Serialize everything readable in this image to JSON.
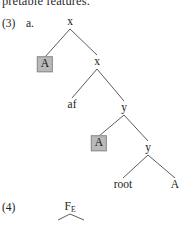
{
  "page": {
    "width": 185,
    "height": 227,
    "background": "#ffffff",
    "clipped_running_text": "pretable features."
  },
  "examples": [
    {
      "number": "(3)",
      "sublabel": "a.",
      "tree": {
        "type": "syntax-tree",
        "nodes": [
          {
            "id": "n1",
            "label": "x",
            "x": 70,
            "y": 22,
            "shaded": false
          },
          {
            "id": "n2",
            "label": "A",
            "x": 45,
            "y": 64,
            "shaded": true
          },
          {
            "id": "n3",
            "label": "x",
            "x": 97,
            "y": 62,
            "shaded": false
          },
          {
            "id": "n4",
            "label": "af",
            "x": 72,
            "y": 105,
            "shaded": false
          },
          {
            "id": "n5",
            "label": "y",
            "x": 124,
            "y": 108,
            "shaded": false
          },
          {
            "id": "n6",
            "label": "A",
            "x": 99,
            "y": 143,
            "shaded": true
          },
          {
            "id": "n7",
            "label": "y",
            "x": 148,
            "y": 148,
            "shaded": false
          },
          {
            "id": "n8",
            "label": "root",
            "x": 123,
            "y": 185,
            "shaded": false
          },
          {
            "id": "n9",
            "label": "A",
            "x": 175,
            "y": 185,
            "shaded": false
          }
        ],
        "edges": [
          {
            "from": "n1",
            "to": "n2"
          },
          {
            "from": "n1",
            "to": "n3"
          },
          {
            "from": "n3",
            "to": "n4"
          },
          {
            "from": "n3",
            "to": "n5"
          },
          {
            "from": "n5",
            "to": "n6"
          },
          {
            "from": "n5",
            "to": "n7"
          },
          {
            "from": "n7",
            "to": "n8"
          },
          {
            "from": "n7",
            "to": "n9"
          }
        ]
      }
    },
    {
      "number": "(4)",
      "sublabel": "",
      "tree": {
        "type": "syntax-tree",
        "nodes": [
          {
            "id": "m1",
            "label": "F",
            "subscript": "E",
            "x": 70,
            "y": 207,
            "shaded": false
          },
          {
            "id": "m2",
            "label": "",
            "x": 58,
            "y": 227,
            "shaded": false
          },
          {
            "id": "m3",
            "label": "",
            "x": 84,
            "y": 227,
            "shaded": false
          }
        ],
        "edges": [
          {
            "from": "m1",
            "to": "m2"
          },
          {
            "from": "m1",
            "to": "m3"
          }
        ]
      }
    }
  ],
  "colors": {
    "text": "#1c1c1c",
    "edge": "#4a4a4a",
    "shaded_fill": "#b9b9b9",
    "shaded_border": "#8d8d8d"
  }
}
